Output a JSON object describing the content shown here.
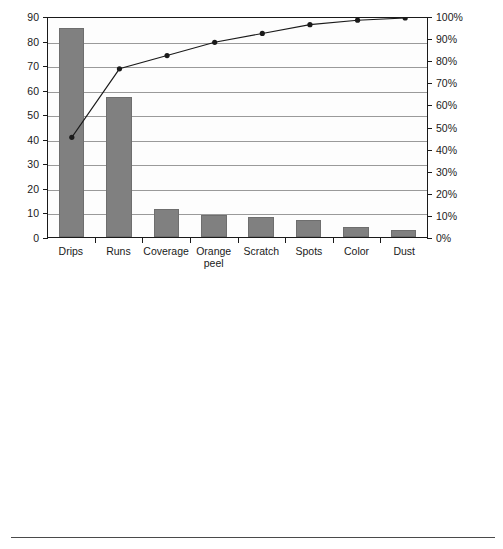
{
  "figure": {
    "divider_present": true,
    "bar_color": "#808080",
    "line_color": "#1a1a1a",
    "axis_color": "#1a1a1a",
    "grid_color": "#9a9a9a"
  },
  "charts": [
    {
      "id": "defect-count-pareto",
      "title": "",
      "chart_type": "pareto",
      "categories": [
        "Drips",
        "Runs",
        "Coverage",
        "Orange\npeel",
        "Scratch",
        "Spots",
        "Color",
        "Dust"
      ],
      "bar_values": [
        85,
        57,
        11.5,
        9,
        8,
        7,
        4,
        3
      ],
      "cumulative_percent": [
        46,
        77,
        83,
        89,
        93,
        97,
        99,
        100
      ],
      "left_axis": {
        "min": 0,
        "max": 90,
        "step": 10,
        "ticks": [
          "0",
          "10",
          "20",
          "30",
          "40",
          "50",
          "60",
          "70",
          "80",
          "90"
        ]
      },
      "right_axis": {
        "min": 0,
        "max": 100,
        "step": 10,
        "ticks": [
          "0%",
          "10%",
          "20%",
          "30%",
          "40%",
          "50%",
          "60%",
          "70%",
          "80%",
          "90%",
          "100%"
        ]
      }
    },
    {
      "id": "defect-cost-pareto",
      "title": "",
      "chart_type": "pareto",
      "categories": [
        "Color",
        "Coverage",
        "Orange\npeel",
        "Spots",
        "Scratch",
        "Dust",
        "Drips",
        "Runs"
      ],
      "bar_values": [
        12000,
        7450,
        1620,
        1520,
        1250,
        1000,
        650,
        120
      ],
      "cumulative_percent": [
        46,
        77,
        83,
        88,
        92,
        96,
        99,
        100
      ],
      "left_axis": {
        "min": 0,
        "max": 14000,
        "step": 2000,
        "ticks": [
          "$0",
          "$2,000",
          "$4,000",
          "$6,000",
          "$8,000",
          "$10,000",
          "$12,000",
          "$14,000"
        ]
      },
      "right_axis": {
        "min": 0,
        "max": 100,
        "step": 10,
        "ticks": [
          "0%",
          "10%",
          "20%",
          "30%",
          "40%",
          "50%",
          "60%",
          "70%",
          "80%",
          "90%",
          "100%"
        ]
      }
    }
  ]
}
